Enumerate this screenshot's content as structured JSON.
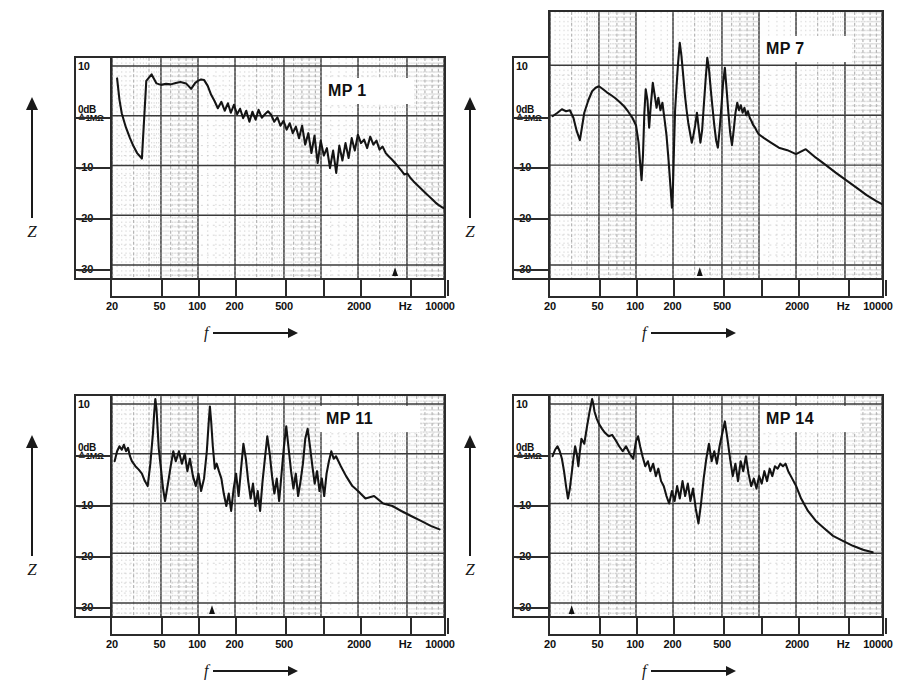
{
  "figure": {
    "background": "#ffffff",
    "ink": "#1a1a1a",
    "panel_count": 4
  },
  "axes_common": {
    "y_axis_symbol": "Z",
    "x_axis_symbol": "f",
    "y_ticks": [
      "10",
      "0dB",
      "-10",
      "-20",
      "-30"
    ],
    "y_zero_sub": "≙1MΩ",
    "y_unit": "dB",
    "y_reference": "≙1MΩ",
    "x_ticks": [
      "20",
      "50",
      "100",
      "200",
      "500",
      "2000",
      "Hz",
      "10000"
    ],
    "x_unit": "Hz",
    "x_scale": "log",
    "y_min": -33,
    "y_max": 12
  },
  "panels": [
    {
      "id": "mp1",
      "title": "MP 1",
      "position": "top-left"
    },
    {
      "id": "mp7",
      "title": "MP 7",
      "position": "top-right"
    },
    {
      "id": "mp11",
      "title": "MP 11",
      "position": "bottom-left"
    },
    {
      "id": "mp14",
      "title": "MP 14",
      "position": "bottom-right"
    }
  ],
  "chart_data": [
    {
      "type": "line",
      "title": "MP 1",
      "xlabel": "f",
      "ylabel": "Z",
      "xunit": "Hz",
      "yunit": "dB",
      "yref": "≙1MΩ",
      "xscale": "log",
      "xlim": [
        20,
        10000
      ],
      "ylim": [
        -33,
        12
      ],
      "grid": true,
      "xticks": [
        20,
        50,
        100,
        200,
        500,
        2000,
        10000
      ],
      "xticklabels": [
        "20",
        "50",
        "100",
        "200",
        "500",
        "2000",
        "10000"
      ],
      "yticks": [
        10,
        0,
        -10,
        -20,
        -30
      ],
      "yticklabels": [
        "10",
        "0dB",
        "-10",
        "-20",
        "-30"
      ],
      "legend": false,
      "series": [
        {
          "name": "MP 1",
          "x": [
            22,
            23,
            24,
            25,
            26,
            28,
            30,
            32,
            35,
            38,
            42,
            46,
            50,
            55,
            60,
            66,
            72,
            80,
            88,
            95,
            100,
            106,
            112,
            120,
            128,
            136,
            145,
            155,
            165,
            175,
            185,
            196,
            208,
            220,
            233,
            247,
            262,
            277,
            294,
            311,
            330,
            350,
            371,
            393,
            417,
            442,
            468,
            496,
            526,
            557,
            590,
            625,
            663,
            702,
            744,
            789,
            836,
            886,
            939,
            995,
            1054,
            1117,
            1184,
            1255,
            1330,
            1409,
            1493,
            1582,
            1677,
            1777,
            1883,
            1995,
            2114,
            2240,
            2374,
            2515,
            2666,
            2825,
            2993,
            3172,
            3360,
            3561,
            3773,
            3998,
            4237,
            4490,
            4757,
            5041,
            5342,
            5660,
            5998,
            6356,
            6735,
            7137,
            7563,
            8014,
            8492,
            8999,
            9536,
            10000
          ],
          "y": [
            7.5,
            3.2,
            0.5,
            -1.0,
            -2.4,
            -4.5,
            -6.2,
            -7.5,
            -8.6,
            7.0,
            8.3,
            6.5,
            6.2,
            6.4,
            6.3,
            6.6,
            6.8,
            6.5,
            5.4,
            6.6,
            7.0,
            7.3,
            7.2,
            6.0,
            4.2,
            3.0,
            1.5,
            2.8,
            1.0,
            2.5,
            0.6,
            2.2,
            0.3,
            1.4,
            -0.5,
            1.0,
            -1.2,
            0.8,
            -0.8,
            1.2,
            -0.4,
            0.3,
            0.9,
            0.2,
            -1.2,
            -0.3,
            -2.0,
            -1.0,
            -2.8,
            -1.5,
            -3.5,
            -2.2,
            -4.5,
            -2.0,
            -5.8,
            -3.5,
            -7.5,
            -4.0,
            -9.5,
            -5.0,
            -8.0,
            -6.5,
            -10.5,
            -7.0,
            -11.5,
            -6.0,
            -9.0,
            -5.5,
            -8.5,
            -4.5,
            -7.0,
            -3.8,
            -5.5,
            -4.8,
            -6.5,
            -4.2,
            -5.8,
            -5.0,
            -6.8,
            -6.2,
            -7.5,
            -8.2,
            -8.8,
            -9.5,
            -10.2,
            -11.0,
            -11.8,
            -11.6,
            -12.5,
            -13.2,
            -13.8,
            -14.4,
            -15.0,
            -15.6,
            -16.2,
            -16.8,
            -17.4,
            -17.9,
            -18.3,
            -18.6
          ]
        }
      ]
    },
    {
      "type": "line",
      "title": "MP 7",
      "xlabel": "f",
      "ylabel": "Z",
      "xunit": "Hz",
      "yunit": "dB",
      "yref": "≙1MΩ",
      "xscale": "log",
      "xlim": [
        20,
        10000
      ],
      "ylim": [
        -33,
        12
      ],
      "grid": true,
      "xticks": [
        20,
        50,
        100,
        200,
        500,
        2000,
        10000
      ],
      "xticklabels": [
        "20",
        "50",
        "100",
        "200",
        "500",
        "2000",
        "10000"
      ],
      "yticks": [
        10,
        0,
        -10,
        -20,
        -30
      ],
      "yticklabels": [
        "10",
        "0dB",
        "-10",
        "-20",
        "-30"
      ],
      "legend": false,
      "series": [
        {
          "name": "MP 7",
          "x": [
            21,
            23,
            25,
            27,
            29,
            31,
            33,
            35,
            38,
            41,
            44,
            47,
            50,
            54,
            58,
            63,
            68,
            74,
            80,
            86,
            93,
            100,
            105,
            108,
            111,
            114,
            117,
            120,
            124,
            128,
            132,
            137,
            142,
            147,
            152,
            158,
            164,
            170,
            177,
            184,
            191,
            196,
            200,
            204,
            208,
            214,
            220,
            227,
            234,
            242,
            250,
            258,
            266,
            275,
            284,
            293,
            303,
            313,
            323,
            334,
            345,
            356,
            368,
            380,
            393,
            406,
            419,
            433,
            448,
            463,
            478,
            494,
            511,
            528,
            546,
            564,
            583,
            603,
            623,
            644,
            666,
            688,
            712,
            736,
            761,
            787,
            813,
            841,
            870,
            899,
            930,
            962,
            995,
            1100,
            1250,
            1450,
            1700,
            2000,
            2400,
            2900,
            3500,
            4200,
            5100,
            6200,
            7500,
            9000,
            10000
          ],
          "y": [
            -0.2,
            0.5,
            1.2,
            0.8,
            1.0,
            -0.5,
            -3.2,
            -5.0,
            0.5,
            3.0,
            4.8,
            5.5,
            5.8,
            5.2,
            4.6,
            4.0,
            3.4,
            2.6,
            1.8,
            0.8,
            -0.4,
            -2.0,
            -5.5,
            -9.5,
            -13.0,
            -8.0,
            0.5,
            5.2,
            3.0,
            -2.5,
            2.0,
            6.5,
            4.0,
            1.5,
            3.5,
            1.0,
            2.5,
            -0.5,
            -4.0,
            -9.0,
            -14.5,
            -18.5,
            -14.0,
            -6.0,
            1.0,
            6.0,
            10.5,
            14.5,
            12.0,
            8.0,
            4.0,
            1.0,
            -1.5,
            -3.5,
            -5.5,
            -4.0,
            -2.0,
            0.5,
            -2.5,
            -5.5,
            -3.0,
            2.0,
            7.0,
            11.5,
            9.0,
            5.0,
            1.5,
            -2.0,
            -5.0,
            -6.5,
            -3.0,
            1.5,
            6.5,
            9.5,
            5.0,
            0.5,
            -3.5,
            -6.0,
            -3.0,
            0.5,
            2.5,
            1.0,
            2.0,
            0.5,
            1.5,
            0.0,
            0.8,
            -0.5,
            -1.2,
            -2.0,
            -2.5,
            -3.2,
            -3.8,
            -4.6,
            -5.5,
            -6.5,
            -7.0,
            -7.8,
            -6.8,
            -8.5,
            -10.0,
            -11.5,
            -13.0,
            -14.5,
            -16.0,
            -17.2,
            -17.8
          ]
        }
      ]
    },
    {
      "type": "line",
      "title": "MP 11",
      "xlabel": "f",
      "ylabel": "Z",
      "xunit": "Hz",
      "yunit": "dB",
      "yref": "≙1MΩ",
      "xscale": "log",
      "xlim": [
        20,
        10000
      ],
      "ylim": [
        -33,
        12
      ],
      "grid": true,
      "xticks": [
        20,
        50,
        100,
        200,
        500,
        2000,
        10000
      ],
      "xticklabels": [
        "20",
        "50",
        "100",
        "200",
        "500",
        "2000",
        "10000"
      ],
      "yticks": [
        10,
        0,
        -10,
        -20,
        -30
      ],
      "yticklabels": [
        "10",
        "0dB",
        "-10",
        "-20",
        "-30"
      ],
      "legend": false,
      "series": [
        {
          "name": "MP 11",
          "x": [
            21,
            22,
            23,
            24,
            25,
            26,
            27,
            28,
            29,
            31,
            33,
            35,
            37,
            39,
            41,
            43,
            44,
            45,
            46,
            47,
            48,
            50,
            52,
            54,
            57,
            60,
            63,
            66,
            70,
            74,
            78,
            82,
            86,
            91,
            96,
            101,
            106,
            112,
            118,
            122,
            125,
            128,
            132,
            137,
            142,
            148,
            155,
            162,
            170,
            178,
            186,
            195,
            204,
            214,
            224,
            234,
            245,
            256,
            268,
            280,
            293,
            306,
            320,
            335,
            350,
            366,
            383,
            400,
            418,
            437,
            457,
            478,
            500,
            522,
            546,
            571,
            597,
            624,
            652,
            682,
            713,
            745,
            779,
            814,
            851,
            889,
            930,
            972,
            1016,
            1062,
            1110,
            1160,
            1213,
            1268,
            1325,
            1450,
            1600,
            1800,
            2000,
            2300,
            2700,
            3200,
            3800,
            4500,
            5400,
            6500,
            7800,
            9200,
            10000
          ],
          "y": [
            -1.5,
            0.5,
            1.5,
            0.8,
            1.8,
            0.5,
            1.2,
            -0.5,
            -1.5,
            -2.5,
            -3.2,
            -4.0,
            -5.5,
            -6.5,
            -2.0,
            4.0,
            8.0,
            11.0,
            9.0,
            5.0,
            1.0,
            -3.0,
            -7.0,
            -9.5,
            -6.0,
            -2.5,
            0.5,
            -1.5,
            0.5,
            -2.0,
            0.0,
            -3.5,
            -1.0,
            -4.5,
            -6.5,
            -4.0,
            -7.5,
            -5.0,
            0.5,
            6.0,
            9.5,
            6.5,
            1.5,
            -3.0,
            -2.0,
            -3.5,
            -5.0,
            -8.0,
            -10.5,
            -8.0,
            -11.5,
            -7.0,
            -4.0,
            -8.5,
            -3.0,
            2.0,
            -1.0,
            -5.5,
            -9.0,
            -6.0,
            -10.5,
            -7.5,
            -11.5,
            -5.5,
            -1.0,
            3.5,
            0.0,
            -4.5,
            -8.0,
            -5.0,
            -9.5,
            -4.0,
            1.5,
            5.5,
            1.0,
            -3.5,
            -7.0,
            -4.0,
            -8.5,
            -5.5,
            -2.0,
            3.0,
            5.0,
            1.5,
            -2.5,
            -6.0,
            -3.5,
            -7.5,
            -5.0,
            -8.5,
            -4.0,
            -1.5,
            0.5,
            -1.0,
            -0.5,
            -2.5,
            -4.5,
            -6.5,
            -7.5,
            -9.0,
            -8.5,
            -10.0,
            -10.5,
            -11.5,
            -12.5,
            -13.5,
            -14.5,
            -15.2
          ]
        }
      ]
    },
    {
      "type": "line",
      "title": "MP 14",
      "xlabel": "f",
      "ylabel": "Z",
      "xunit": "Hz",
      "yunit": "dB",
      "yref": "≙1MΩ",
      "xscale": "log",
      "xlim": [
        20,
        10000
      ],
      "ylim": [
        -33,
        12
      ],
      "grid": true,
      "xticks": [
        20,
        50,
        100,
        200,
        500,
        2000,
        10000
      ],
      "xticklabels": [
        "20",
        "50",
        "100",
        "200",
        "500",
        "2000",
        "10000"
      ],
      "yticks": [
        10,
        0,
        -10,
        -20,
        -30
      ],
      "yticklabels": [
        "10",
        "0dB",
        "-10",
        "-20",
        "-30"
      ],
      "legend": false,
      "series": [
        {
          "name": "MP 14",
          "x": [
            21,
            22,
            23,
            24,
            25,
            26,
            27,
            28,
            29,
            30,
            31,
            32,
            33,
            34,
            35,
            36,
            38,
            40,
            42,
            44,
            45,
            46,
            48,
            50,
            53,
            56,
            60,
            64,
            68,
            73,
            78,
            83,
            89,
            95,
            100,
            104,
            108,
            113,
            119,
            125,
            131,
            138,
            145,
            152,
            160,
            168,
            177,
            186,
            196,
            206,
            216,
            227,
            239,
            251,
            264,
            277,
            291,
            306,
            322,
            338,
            355,
            373,
            392,
            412,
            433,
            455,
            478,
            502,
            528,
            554,
            582,
            612,
            643,
            675,
            710,
            745,
            783,
            822,
            864,
            908,
            954,
            1002,
            1053,
            1106,
            1162,
            1221,
            1283,
            1348,
            1417,
            1489,
            1565,
            1644,
            1728,
            1816,
            1908,
            2005,
            2200,
            2500,
            2900,
            3400,
            4000,
            4800,
            5800,
            7000,
            8400,
            10000
          ],
          "y": [
            -0.5,
            0.8,
            1.5,
            0.5,
            -1.0,
            -3.5,
            -6.5,
            -9.0,
            -7.0,
            -4.0,
            -1.0,
            1.5,
            0.0,
            -2.5,
            0.5,
            3.0,
            2.0,
            5.5,
            8.5,
            11.0,
            10.0,
            8.5,
            7.0,
            6.0,
            5.0,
            4.2,
            3.5,
            3.8,
            2.8,
            1.5,
            0.5,
            1.5,
            0.0,
            -1.0,
            2.5,
            3.5,
            1.5,
            -0.5,
            -2.5,
            -1.5,
            -3.5,
            -2.0,
            -4.5,
            -3.0,
            -5.5,
            -6.5,
            -8.5,
            -10.0,
            -7.5,
            -9.5,
            -6.5,
            -9.0,
            -5.5,
            -8.5,
            -6.0,
            -9.5,
            -7.0,
            -11.0,
            -14.0,
            -10.0,
            -5.0,
            -1.0,
            2.0,
            -1.5,
            0.5,
            -2.0,
            1.5,
            4.0,
            6.5,
            3.0,
            -1.0,
            -4.5,
            -2.0,
            -5.5,
            -1.5,
            -3.5,
            -0.5,
            -4.0,
            -6.5,
            -5.0,
            -7.0,
            -4.5,
            -6.0,
            -3.5,
            -5.5,
            -3.0,
            -4.5,
            -2.5,
            -3.0,
            -2.0,
            -2.5,
            -2.0,
            -3.5,
            -4.5,
            -5.5,
            -6.5,
            -9.0,
            -11.5,
            -13.5,
            -15.0,
            -16.5,
            -17.5,
            -18.5,
            -19.3,
            -19.8
          ]
        }
      ]
    }
  ]
}
